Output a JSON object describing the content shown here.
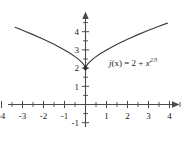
{
  "chart_data": {
    "type": "line",
    "title": "",
    "subtitle": "",
    "xlabel": "x",
    "ylabel": "y",
    "xlim": [
      -4.6,
      4.6
    ],
    "ylim": [
      -1.4,
      5.1
    ],
    "grid": false,
    "legend_position": "inline-annotation",
    "x_ticks_major": [
      -4,
      -3,
      -2,
      -1,
      1,
      2,
      3,
      4
    ],
    "x_tick_labels": [
      "-4",
      "-3",
      "-2",
      "-1",
      "1",
      "2",
      "3",
      "4"
    ],
    "x_ticks_minor": [
      -4.5,
      -3.5,
      -2.5,
      -1.5,
      -0.5,
      0.5,
      1.5,
      2.5,
      3.5,
      4.5
    ],
    "y_ticks_major": [
      -1,
      1,
      2,
      3,
      4
    ],
    "y_tick_labels": [
      "-1",
      "1",
      "2",
      "3",
      "4"
    ],
    "series": [
      {
        "name": "j(x) = 2 + x^(2/3)",
        "formula": "2 + x^(2/3)",
        "color": "#3b3b3b",
        "x": [
          -3.35,
          -3.0,
          -2.5,
          -2.0,
          -1.5,
          -1.0,
          -0.7,
          -0.45,
          -0.25,
          -0.12,
          -0.05,
          -0.015,
          0,
          0.015,
          0.05,
          0.12,
          0.25,
          0.45,
          0.7,
          1.0,
          1.5,
          2.0,
          2.5,
          3.0,
          3.5,
          3.9
        ],
        "y": [
          4.24,
          4.08,
          3.84,
          3.59,
          3.31,
          3.0,
          2.79,
          2.59,
          2.4,
          2.24,
          2.14,
          2.06,
          2.0,
          2.06,
          2.14,
          2.24,
          2.4,
          2.59,
          2.79,
          3.0,
          3.31,
          3.59,
          3.84,
          4.08,
          4.3,
          4.47
        ]
      }
    ],
    "annotations": [
      {
        "name": "function-label",
        "text_plain": "j(x) = 2 + x^(2/3)",
        "lead": "j",
        "arg": "(x) = 2 + ",
        "base": "x",
        "exponent": "2/3",
        "x_px": 109,
        "y_px": 57
      }
    ],
    "cusp_point": {
      "x": 0,
      "y": 2,
      "marker": "dot"
    },
    "axis_arrows": {
      "x_positive": true,
      "y_positive": true
    },
    "axis_color": "#4a4a4a"
  }
}
